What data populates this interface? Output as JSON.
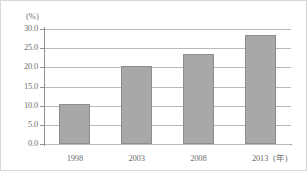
{
  "chart_data": {
    "type": "bar",
    "title": "",
    "subtitle": "",
    "xlabel": "(年)",
    "ylabel": "(%)",
    "categories": [
      "1998",
      "2003",
      "2008",
      "2013"
    ],
    "values": [
      10.4,
      20.4,
      23.4,
      28.5
    ],
    "series": [
      {
        "name": "",
        "values": [
          10.4,
          20.4,
          23.4,
          28.5
        ]
      }
    ],
    "ylim": [
      0.0,
      30.0
    ],
    "ytick_labels": [
      "30.0",
      "25.0",
      "20.0",
      "15.0",
      "10.0",
      "5.0",
      "0.0"
    ],
    "ytick_values": [
      30.0,
      25.0,
      20.0,
      15.0,
      10.0,
      5.0,
      0.0
    ],
    "grid": true,
    "grid_axis": "y",
    "legend": false,
    "legend_position": "none",
    "bar_color": "#a8a8a8",
    "bar_border_color": "#8d8d8d",
    "gridline_color": "#b9b9b9",
    "axis_color": "#8f8f8f",
    "text_color": "#6f6f6f",
    "background": "#ffffff"
  },
  "axes": {
    "y_unit": "(%)",
    "x_unit": "(年)"
  }
}
